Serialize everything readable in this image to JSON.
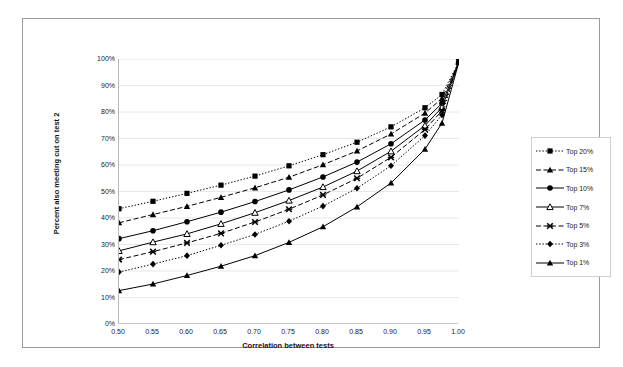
{
  "chart_data": {
    "type": "line",
    "title": "",
    "xlabel": "Correlation between tests",
    "ylabel": "Percent also meeting cut on test 2",
    "xlim": [
      0.5,
      1.0
    ],
    "ylim": [
      0,
      100
    ],
    "grid": true,
    "legend_position": "right",
    "x": [
      0.5,
      0.55,
      0.6,
      0.65,
      0.7,
      0.75,
      0.8,
      0.85,
      0.9,
      0.95,
      0.975,
      1.0
    ],
    "x_ticks": [
      "0.50",
      "0.55",
      "0.60",
      "0.65",
      "0.70",
      "0.75",
      "0.80",
      "0.85",
      "0.90",
      "0.95",
      "1.00"
    ],
    "x_tick_values": [
      0.5,
      0.55,
      0.6,
      0.65,
      0.7,
      0.75,
      0.8,
      0.85,
      0.9,
      0.95,
      1.0
    ],
    "y_ticks": [
      "0%",
      "10%",
      "20%",
      "30%",
      "40%",
      "50%",
      "60%",
      "70%",
      "80%",
      "90%",
      "100%"
    ],
    "y_tick_values": [
      0,
      10,
      20,
      30,
      40,
      50,
      60,
      70,
      80,
      90,
      100
    ],
    "series": [
      {
        "name": "Top 20%",
        "marker": "square",
        "line": "dotted",
        "values": [
          43.5,
          46.3,
          49.3,
          52.4,
          55.8,
          59.7,
          63.9,
          68.6,
          74.4,
          81.6,
          86.6,
          99.0
        ]
      },
      {
        "name": "Top 15%",
        "marker": "triangle",
        "line": "dashed",
        "values": [
          38.2,
          41.3,
          44.4,
          47.8,
          51.4,
          55.4,
          60.1,
          65.3,
          71.7,
          79.6,
          85.1,
          99.0
        ]
      },
      {
        "name": "Top 10%",
        "marker": "circle",
        "line": "solid",
        "values": [
          32.2,
          35.2,
          38.6,
          42.2,
          46.2,
          50.6,
          55.5,
          61.1,
          68.0,
          77.0,
          83.3,
          99.0
        ]
      },
      {
        "name": "Top 7%",
        "marker": "triangle-open",
        "line": "solid",
        "values": [
          27.6,
          30.9,
          34.0,
          37.8,
          42.0,
          46.6,
          51.7,
          57.7,
          65.2,
          74.9,
          81.7,
          99.0
        ]
      },
      {
        "name": "Top 5%",
        "marker": "x",
        "line": "dashed",
        "values": [
          24.3,
          27.3,
          30.6,
          34.2,
          38.5,
          43.3,
          48.7,
          55.0,
          62.9,
          73.4,
          80.5,
          99.0
        ]
      },
      {
        "name": "Top 3%",
        "marker": "diamond",
        "line": "dotted",
        "values": [
          19.6,
          22.6,
          25.8,
          29.7,
          33.8,
          38.8,
          44.5,
          51.2,
          59.7,
          71.1,
          78.9,
          99.0
        ]
      },
      {
        "name": "Top 1%",
        "marker": "triangle-filled",
        "line": "solid",
        "values": [
          12.6,
          15.1,
          18.3,
          21.8,
          25.8,
          30.8,
          36.7,
          44.2,
          53.2,
          66.0,
          75.8,
          99.0
        ]
      }
    ]
  },
  "legend": {
    "items": [
      {
        "label": "Top 20%"
      },
      {
        "label": "Top 15%"
      },
      {
        "label": "Top 10%"
      },
      {
        "label": "Top 7%"
      },
      {
        "label": "Top 5%"
      },
      {
        "label": "Top 3%"
      },
      {
        "label": "Top 1%"
      }
    ]
  },
  "colors": {
    "series": "#000000",
    "grid": "#e2e2e2",
    "axis": "#b8b8b8",
    "frame": "#9a9a9a",
    "text": "#1a1a1a",
    "background": "#ffffff"
  }
}
